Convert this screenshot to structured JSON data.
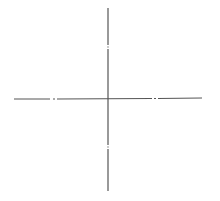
{
  "diagram": {
    "type": "cross-axes",
    "line_color": "#555555",
    "background": "#ffffff",
    "vertical_axis": {
      "x": 108,
      "y1": 8,
      "y2": 191,
      "gaps": [
        46,
        146
      ]
    },
    "horizontal_axis": {
      "y": 99,
      "x1": 14,
      "x2": 202,
      "gaps": [
        53,
        155
      ]
    },
    "origin": {
      "x": 108,
      "y": 99
    }
  }
}
